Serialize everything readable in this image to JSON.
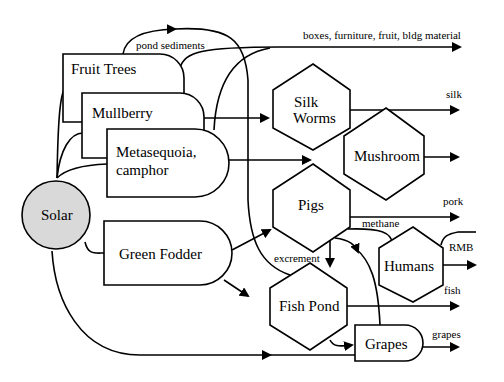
{
  "diagram": {
    "source": {
      "label": "Solar",
      "fill": "#d9d9d9"
    },
    "producers": [
      {
        "label": "Fruit Trees"
      },
      {
        "label": "Mullberry"
      },
      {
        "label_line1": "Metasequoia,",
        "label_line2": "camphor"
      },
      {
        "label": "Green Fodder"
      },
      {
        "label": "Grapes"
      }
    ],
    "consumers": [
      {
        "label_line1": "Silk",
        "label_line2": "Worms"
      },
      {
        "label": "Mushroom"
      },
      {
        "label": "Pigs"
      },
      {
        "label": "Fish Pond"
      },
      {
        "label": "Humans"
      }
    ],
    "flow_labels": {
      "pond_sediments": "pond sediments",
      "boxes": "boxes, furniture, fruit, bldg material",
      "silk": "silk",
      "pork": "pork",
      "methane": "methane",
      "rmb": "RMB",
      "excrement": "excrement",
      "fish": "fish",
      "grapes": "grapes"
    }
  }
}
